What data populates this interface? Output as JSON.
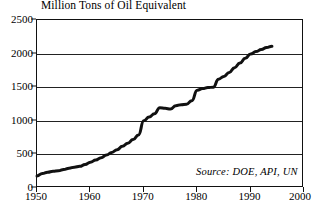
{
  "chart_data": {
    "type": "line",
    "title": "Million Tons of Oil Equivalent",
    "xlabel": "",
    "ylabel": "",
    "xlim": [
      1950,
      2000
    ],
    "ylim": [
      0,
      2500
    ],
    "xticks": [
      1950,
      1960,
      1970,
      1980,
      1990,
      2000
    ],
    "xtick_labels": [
      "1950",
      "1960",
      "1970",
      "1980",
      "1990",
      "2000"
    ],
    "yticks": [
      0,
      500,
      1000,
      1500,
      2000,
      2500
    ],
    "ytick_labels": [
      "0",
      "500",
      "1000",
      "1500",
      "2000",
      "2500"
    ],
    "grid": "horizontal",
    "legend": "none",
    "annotation": "Source: DOE, API, UN",
    "line_color": "#111111",
    "line_width": 3,
    "series": [
      {
        "name": "World oil equivalent consumption",
        "x": [
          1950,
          1951,
          1952,
          1953,
          1954,
          1955,
          1956,
          1957,
          1958,
          1959,
          1960,
          1961,
          1962,
          1963,
          1964,
          1965,
          1966,
          1967,
          1968,
          1969,
          1970,
          1971,
          1972,
          1973,
          1974,
          1975,
          1976,
          1977,
          1978,
          1979,
          1980,
          1981,
          1982,
          1983,
          1984,
          1985,
          1986,
          1987,
          1988,
          1989,
          1990,
          1991,
          1992,
          1993,
          1994
        ],
        "values": [
          180,
          215,
          235,
          248,
          255,
          275,
          295,
          310,
          322,
          350,
          385,
          415,
          450,
          490,
          530,
          570,
          620,
          665,
          720,
          790,
          1000,
          1055,
          1105,
          1195,
          1185,
          1175,
          1225,
          1240,
          1245,
          1300,
          1455,
          1480,
          1495,
          1500,
          1620,
          1660,
          1720,
          1790,
          1860,
          1930,
          1995,
          2030,
          2060,
          2090,
          2110
        ]
      }
    ]
  }
}
